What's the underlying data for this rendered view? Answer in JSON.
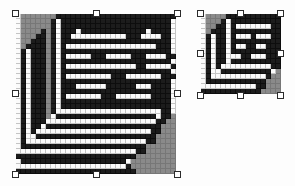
{
  "canvas": {
    "background_color": "#fdfdfd",
    "description": "bitmap-editor-canvas"
  },
  "palette": {
    "ink": "#1c1c1c",
    "paper": "#fbfbfb",
    "shadow": "#8a8a8a",
    "gridline": "#c4c4c4",
    "handle_fill": "#ffffff",
    "handle_border": "#2b2b2b"
  },
  "objects": [
    {
      "name": "document-icon-large",
      "left": 16,
      "top": 14,
      "cell": 5,
      "cols": 32,
      "rows": 32,
      "selected": true,
      "handles": [
        {
          "name": "handle-top-left",
          "x": 12,
          "y": 10
        },
        {
          "name": "handle-top-center",
          "x": 93,
          "y": 10
        },
        {
          "name": "handle-top-right",
          "x": 174,
          "y": 10
        },
        {
          "name": "handle-middle-left",
          "x": 12,
          "y": 90
        },
        {
          "name": "handle-middle-right",
          "x": 174,
          "y": 90
        },
        {
          "name": "handle-bottom-left",
          "x": 12,
          "y": 171
        },
        {
          "name": "handle-bottom-center",
          "x": 93,
          "y": 171
        },
        {
          "name": "handle-bottom-right",
          "x": 174,
          "y": 171
        }
      ],
      "pixels": [
        "02222222111111111111111111111111",
        "02222221011111111111111111111110",
        "02222221011111111111111111111110",
        "02222121011101111111111111011110",
        "02221121011000000000001110000110",
        "02211121011111111111111111111110",
        "02111121010000000000000000001110",
        "01011121011111111111111111111110",
        "01011121010000011100000111000011",
        "01011121011111111111111111111110",
        "01011121010000000000000011000001",
        "01011121011111111111111111111110",
        "01011121010000000001110000000111",
        "01011121011111111111111111111110",
        "01011121011100000011111100011110",
        "01011121011111111111111111111110",
        "01011121010000000111000000011110",
        "01011121011111111111111111111110",
        "01011121011111111111111111111110",
        "01011121000000000000000000000110",
        "01011120111111111111111111110112",
        "01011100000000000000000000001122",
        "01011011111111111111111111111222",
        "01010000000000000000000000011222",
        "01001111111111111111111111112222",
        "01000000000000000000000000112222",
        "01111111111111111111111111222222",
        "00000000000000000000000011222222",
        "11111111111111111111111122222222",
        "01111111111111111111110222222222",
        "00000000000000000000001222222222",
        "11111111111111111111111122222222"
      ]
    },
    {
      "name": "document-icon-small",
      "left": 201,
      "top": 14,
      "cell": 5,
      "cols": 16,
      "rows": 16,
      "selected": true,
      "handles": [
        {
          "name": "handle-top-left",
          "x": 197,
          "y": 10
        },
        {
          "name": "handle-top-center",
          "x": 237,
          "y": 10
        },
        {
          "name": "handle-top-right",
          "x": 277,
          "y": 10
        },
        {
          "name": "handle-middle-left",
          "x": 197,
          "y": 50
        },
        {
          "name": "handle-middle-right",
          "x": 277,
          "y": 50
        },
        {
          "name": "handle-bottom-left",
          "x": 197,
          "y": 92
        },
        {
          "name": "handle-bottom-center",
          "x": 237,
          "y": 92
        },
        {
          "name": "handle-bottom-right",
          "x": 277,
          "y": 92
        }
      ],
      "pixels": [
        "0222211111111111",
        "0222101111111111",
        "0221101000000011",
        "0211101111111111",
        "0101101000100011",
        "0101101111111111",
        "0101101001100111",
        "0101101111111111",
        "0101100011000111",
        "0101101111111111",
        "0101000000000011",
        "0100111111111102",
        "0100000000000122",
        "0111111111111222",
        "0000000000011222",
        "1111111111112222"
      ]
    }
  ]
}
